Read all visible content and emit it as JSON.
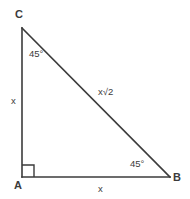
{
  "diagram": {
    "type": "geometry-figure",
    "shape": "right-triangle",
    "background_color": "#ffffff",
    "stroke_color": "#3b3b3b",
    "text_color": "#3b3b3b",
    "canvas": {
      "width": 190,
      "height": 199
    },
    "vertices": [
      {
        "id": "C",
        "label": "C",
        "x": 22,
        "y": 28
      },
      {
        "id": "A",
        "label": "A",
        "x": 22,
        "y": 177
      },
      {
        "id": "B",
        "label": "B",
        "x": 170,
        "y": 177
      }
    ],
    "edges": [
      {
        "id": "AC",
        "from": "A",
        "to": "C",
        "label": "x"
      },
      {
        "id": "AB",
        "from": "A",
        "to": "B",
        "label": "x"
      },
      {
        "id": "CB",
        "from": "C",
        "to": "B",
        "label": "x√2"
      }
    ],
    "angles": [
      {
        "id": "angle-c",
        "at": "C",
        "label": "45°"
      },
      {
        "id": "angle-b",
        "at": "B",
        "label": "45°"
      },
      {
        "id": "angle-a",
        "at": "A",
        "label": "",
        "marker": "right-angle-square"
      }
    ],
    "markers": {
      "right_angle": {
        "at": "A",
        "size": 12
      }
    }
  }
}
